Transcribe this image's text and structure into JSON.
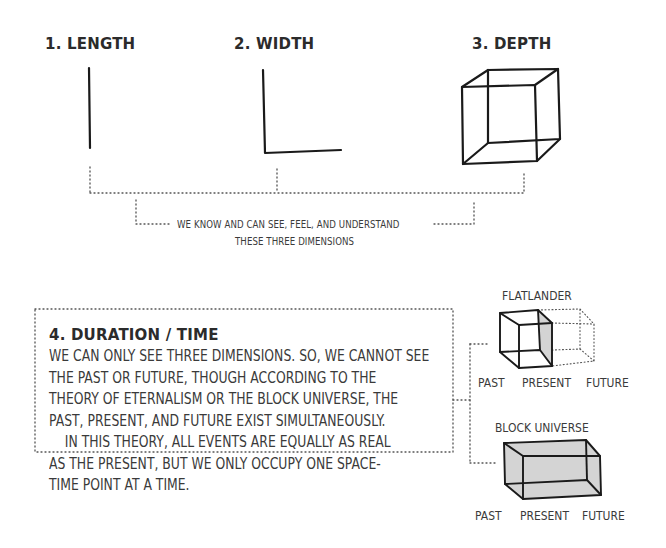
{
  "dimensions": [
    {
      "label": "1. LENGTH",
      "shape": "vertical-line"
    },
    {
      "label": "2. WIDTH",
      "shape": "L-shape"
    },
    {
      "label": "3. DEPTH",
      "shape": "wireframe-cube"
    }
  ],
  "bracket_caption": {
    "line1": "WE KNOW AND CAN SEE, FEEL, AND UNDERSTAND",
    "line2": "THESE THREE DIMENSIONS"
  },
  "duration_box": {
    "title": "4. DURATION / TIME",
    "lines": [
      "WE CAN ONLY SEE THREE DIMENSIONS. SO, WE CANNOT SEE",
      "THE PAST OR FUTURE, THOUGH ACCORDING TO THE",
      "THEORY OF ETERNALISM OR THE BLOCK UNIVERSE, THE",
      "PAST, PRESENT, AND FUTURE EXIST SIMULTANEOUSLY.",
      "    IN THIS THEORY, ALL EVENTS ARE EQUALLY AS REAL",
      "AS THE PRESENT, BUT WE ONLY OCCUPY ONE SPACE-",
      "TIME POINT AT A TIME."
    ]
  },
  "flatlander": {
    "title": "FLATLANDER",
    "axis": [
      "PAST",
      "PRESENT",
      "FUTURE"
    ]
  },
  "block_universe": {
    "title": "BLOCK UNIVERSE",
    "axis": [
      "PAST",
      "PRESENT",
      "FUTURE"
    ]
  },
  "colors": {
    "ink": "#1a1a1a",
    "text": "#3a3a3a",
    "dotted": "#555555",
    "shade": "#d4d4d4"
  }
}
